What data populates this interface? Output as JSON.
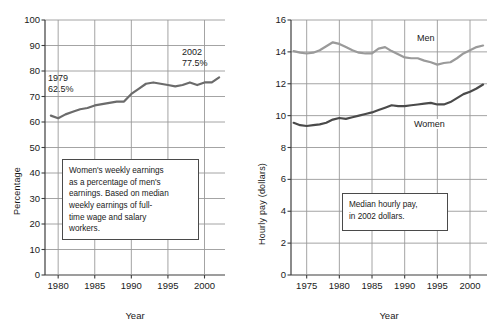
{
  "figure": {
    "background": "#ffffff",
    "axis_color": "#3d3d3d",
    "grid_color": "#9a9a9a"
  },
  "chart_data": [
    {
      "type": "line",
      "title": "",
      "xlabel": "Year",
      "ylabel": "Percentage",
      "xlim": [
        1978.2,
        2002.8
      ],
      "ylim": [
        0,
        100
      ],
      "yticks": [
        "0",
        "10",
        "20",
        "30",
        "40",
        "50",
        "60",
        "70",
        "80",
        "90",
        "100"
      ],
      "xticks": [
        "1980",
        "1985",
        "1990",
        "1995",
        "2000"
      ],
      "grid": "both",
      "legend": "none",
      "line_color": "#6b6b6b",
      "x": [
        1979,
        1980,
        1981,
        1982,
        1983,
        1984,
        1985,
        1986,
        1987,
        1988,
        1989,
        1990,
        1991,
        1992,
        1993,
        1994,
        1995,
        1996,
        1997,
        1998,
        1999,
        2000,
        2001,
        2002
      ],
      "values": [
        62.5,
        61.5,
        63.0,
        64.0,
        65.0,
        65.5,
        66.5,
        67.0,
        67.5,
        68.0,
        68.0,
        71.0,
        73.0,
        75.0,
        75.5,
        75.0,
        74.5,
        74.0,
        74.5,
        75.5,
        74.5,
        75.5,
        75.5,
        77.5
      ],
      "annotations": [
        {
          "name": "1979-callout",
          "line1": "1979",
          "line2": "62.5%"
        },
        {
          "name": "2002-callout",
          "line1": "2002",
          "line2": "77.5%"
        }
      ],
      "note": [
        "Women's weekly earnings",
        "as a percentage of men's",
        "earnings. Based on median",
        "weekly earnings of full-",
        "time wage and salary",
        "workers."
      ]
    },
    {
      "type": "line",
      "title": "",
      "xlabel": "Year",
      "ylabel": "Hourly pay (dollars)",
      "xlim": [
        1972.6,
        2002.6
      ],
      "ylim": [
        0,
        16
      ],
      "yticks": [
        "0",
        "2",
        "4",
        "6",
        "8",
        "10",
        "12",
        "14",
        "16"
      ],
      "xticks": [
        "1975",
        "1980",
        "1985",
        "1990",
        "1995",
        "2000"
      ],
      "grid": "both",
      "legend": "inline-labels",
      "x": [
        1973,
        1974,
        1975,
        1976,
        1977,
        1978,
        1979,
        1980,
        1981,
        1982,
        1983,
        1984,
        1985,
        1986,
        1987,
        1988,
        1989,
        1990,
        1991,
        1992,
        1993,
        1994,
        1995,
        1996,
        1997,
        1998,
        1999,
        2000,
        2001,
        2002
      ],
      "series": [
        {
          "name": "Men",
          "color": "#9a9a9a",
          "values": [
            14.05,
            13.95,
            13.9,
            13.95,
            14.1,
            14.35,
            14.6,
            14.5,
            14.3,
            14.1,
            13.95,
            13.9,
            13.9,
            14.2,
            14.3,
            14.05,
            13.85,
            13.65,
            13.6,
            13.6,
            13.45,
            13.35,
            13.2,
            13.3,
            13.35,
            13.6,
            13.9,
            14.1,
            14.3,
            14.4
          ]
        },
        {
          "name": "Women",
          "color": "#4a4a4a",
          "values": [
            9.55,
            9.4,
            9.35,
            9.4,
            9.45,
            9.55,
            9.75,
            9.85,
            9.8,
            9.9,
            10.0,
            10.1,
            10.2,
            10.35,
            10.5,
            10.65,
            10.6,
            10.6,
            10.65,
            10.7,
            10.75,
            10.8,
            10.7,
            10.7,
            10.85,
            11.1,
            11.35,
            11.5,
            11.7,
            11.95
          ]
        }
      ],
      "note": [
        "Median hourly pay,",
        "in 2002 dollars."
      ]
    }
  ],
  "left_panel": {
    "ylabel": "Percentage",
    "xlabel": "Year",
    "yticks": [
      "100",
      "90",
      "80",
      "70",
      "60",
      "50",
      "40",
      "30",
      "20",
      "10",
      "0"
    ],
    "xticks": [
      "1980",
      "1985",
      "1990",
      "1995",
      "2000"
    ],
    "annot_1979_year": "1979",
    "annot_1979_value": "62.5%",
    "annot_2002_year": "2002",
    "annot_2002_value": "77.5%",
    "note_lines": [
      "Women's weekly earnings",
      "as a percentage of men's",
      "earnings. Based on median",
      "weekly earnings of full-",
      "time wage and salary",
      "workers."
    ]
  },
  "right_panel": {
    "ylabel": "Hourly pay (dollars)",
    "xlabel": "Year",
    "yticks": [
      "16",
      "14",
      "12",
      "10",
      "8",
      "6",
      "4",
      "2",
      "0"
    ],
    "xticks": [
      "1975",
      "1980",
      "1985",
      "1990",
      "1995",
      "2000"
    ],
    "label_men": "Men",
    "label_women": "Women",
    "note_lines": [
      "Median hourly pay,",
      "in 2002 dollars."
    ]
  }
}
